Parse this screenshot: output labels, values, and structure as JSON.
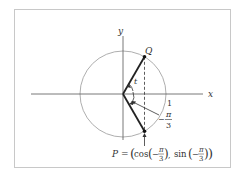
{
  "diagram": {
    "type": "unit-circle",
    "axes": {
      "x_label": "x",
      "y_label": "y"
    },
    "radius_label": "1",
    "points": {
      "Q": {
        "label": "Q",
        "angle": "π/3"
      },
      "P": {
        "label": "P",
        "angle": "-π/3"
      }
    },
    "angle_label_t": "t",
    "angle_annotation": {
      "sign": "−",
      "numerator": "π",
      "denominator": "3"
    },
    "equation": {
      "lhs": "P",
      "eq": "=",
      "cos": "cos",
      "sin": "sin",
      "neg": "−",
      "pi": "π",
      "three": "3"
    }
  }
}
